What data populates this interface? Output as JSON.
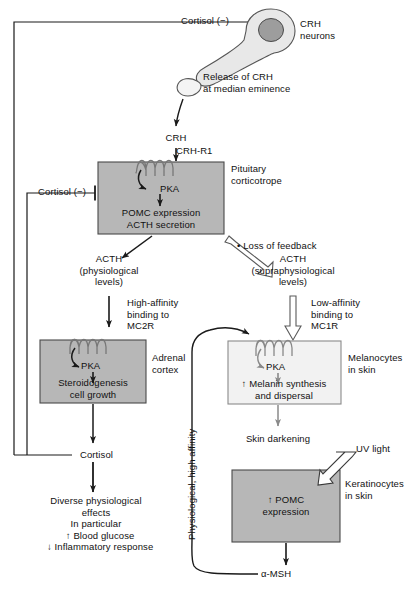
{
  "figure": {
    "type": "pathway-diagram"
  },
  "palette": {
    "stroke": "#1a1a1a",
    "gray_arrow": "#8a8a8a",
    "box_dark_fill": "#b7b7b7",
    "box_dark_stroke": "#4a4a4a",
    "box_light_fill": "#f2f2f2",
    "box_light_stroke": "#8a8a8a",
    "neuron_fill": "#e8e8e8",
    "nucleus_fill": "#9d9d9d",
    "hollow_fill": "#ffffff",
    "page_bg": "#ffffff"
  },
  "nodes": {
    "cortisol_feedback_top": "Cortisol (−)",
    "cortisol_feedback_mid": "Cortisol (−)",
    "crh_neurons": "CRH\nneurons",
    "release_of_crh": "Release of CRH\nat median eminence",
    "crh": "CRH",
    "crh_r1": "CRH-R1",
    "pituitary_pka": "PKA",
    "pituitary_corticotrope": "Pituitary\ncorticotrope",
    "pomc_acth": "POMC expression\nACTH secretion",
    "loss_of_feedback": "• Loss of feedback",
    "acth_physiological": "ACTH\n(physiological\nlevels)",
    "acth_supraphysiological": "ACTH\n(supraphysiological\nlevels)",
    "high_affinity": "High-affinity\nbinding to\nMC2R",
    "low_affinity": "Low-affinity\nbinding to\nMC1R",
    "adrenal_pka": "PKA",
    "adrenal_cortex": "Adrenal\ncortex",
    "steroidogenesis": "Steroidogenesis\ncell growth",
    "cortisol": "Cortisol",
    "diverse_effects": "Diverse physiological\neffects\nIn particular\n   ↑ Blood glucose\n   ↓ Inflammatory response",
    "melanocyte_pka": "PKA",
    "melanocytes_in_skin": "Melanocytes\nin skin",
    "melanin_synthesis": "↑ Melanin synthesis\nand dispersal",
    "skin_darkening": "Skin darkening",
    "uv_light": "UV light",
    "keratinocytes_in_skin": "Keratinocytes\nin skin",
    "pomc_expression_skin": "↑ POMC\nexpression",
    "alpha_msh": "α-MSH",
    "physiological_high_affinity": "Physiological, high affinity"
  }
}
